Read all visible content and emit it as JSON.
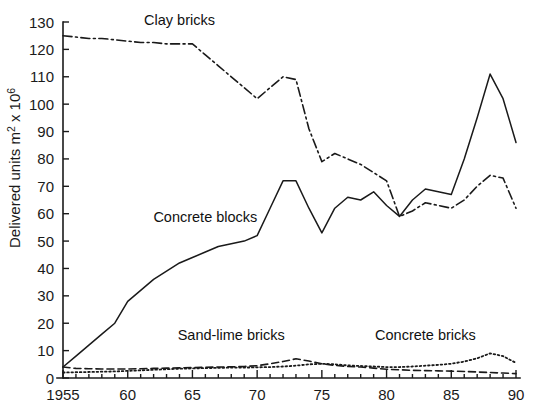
{
  "chart_data": {
    "type": "line",
    "title": "",
    "xlabel": "",
    "ylabel": "Delivered units m² x 10⁶",
    "ylabel_main": "Delivered units m",
    "ylabel_sup1": "2",
    "ylabel_mid": " x 10",
    "ylabel_sup2": "6",
    "xlim": [
      1955,
      1990
    ],
    "ylim": [
      0,
      130
    ],
    "grid": false,
    "legend_position": "inline-annotations",
    "y_ticks": [
      0,
      10,
      20,
      30,
      40,
      50,
      60,
      70,
      80,
      90,
      100,
      110,
      120,
      130
    ],
    "y_tick_labels": [
      "0",
      "10",
      "20",
      "30",
      "40",
      "50",
      "60",
      "70",
      "80",
      "90",
      "100",
      "110",
      "120",
      "130"
    ],
    "x_ticks": [
      1955,
      1960,
      1965,
      1970,
      1975,
      1980,
      1985,
      1990
    ],
    "x_tick_labels": [
      "1955",
      "60",
      "65",
      "70",
      "75",
      "80",
      "85",
      "90"
    ],
    "x_minor_step": 1,
    "x": [
      1955,
      1956,
      1957,
      1958,
      1959,
      1960,
      1961,
      1962,
      1963,
      1964,
      1965,
      1966,
      1967,
      1968,
      1969,
      1970,
      1971,
      1972,
      1973,
      1974,
      1975,
      1976,
      1977,
      1978,
      1979,
      1980,
      1981,
      1982,
      1983,
      1984,
      1985,
      1986,
      1987,
      1988,
      1989,
      1990
    ],
    "series": [
      {
        "name": "Clay bricks",
        "style": "dash-dot",
        "label_x": 1964,
        "label_y": 129,
        "values": [
          125,
          124.5,
          124,
          124,
          123.5,
          123,
          122.5,
          122.5,
          122,
          122,
          122,
          118,
          114,
          110,
          106,
          102,
          106,
          110,
          109,
          91,
          79,
          82,
          80,
          78,
          75,
          72,
          59,
          61,
          64,
          63,
          62,
          65,
          70,
          74,
          73,
          62
        ]
      },
      {
        "name": "Concrete blocks",
        "style": "solid",
        "label_x": 1966,
        "label_y": 57,
        "values": [
          4,
          8,
          12,
          16,
          20,
          28,
          32,
          36,
          39,
          42,
          44,
          46,
          48,
          49,
          50,
          52,
          62,
          72,
          72,
          62,
          53,
          62,
          66,
          65,
          68,
          63,
          59,
          65,
          69,
          68,
          67,
          80,
          95,
          111,
          102,
          86
        ]
      },
      {
        "name": "Sand-lime bricks",
        "style": "dashed",
        "label_x": 1968,
        "label_y": 14,
        "values": [
          4,
          3.5,
          3.4,
          3.3,
          3.3,
          3.3,
          3.4,
          3.5,
          3.6,
          3.7,
          3.8,
          3.9,
          4.0,
          4.1,
          4.2,
          4.5,
          5.2,
          6.0,
          7.0,
          6.2,
          5.2,
          4.6,
          4.2,
          4.0,
          3.6,
          3.2,
          3.0,
          2.8,
          2.7,
          2.6,
          2.5,
          2.4,
          2.2,
          2.0,
          1.8,
          1.6
        ]
      },
      {
        "name": "Concrete bricks",
        "style": "dotted",
        "label_x": 1983,
        "label_y": 14,
        "values": [
          2,
          2.1,
          2.2,
          2.3,
          2.4,
          2.6,
          2.8,
          3.0,
          3.2,
          3.4,
          3.5,
          3.6,
          3.7,
          3.8,
          3.8,
          3.9,
          4.0,
          4.2,
          4.5,
          5.0,
          5.2,
          5.0,
          4.6,
          4.4,
          4.2,
          4.0,
          4.0,
          4.2,
          4.5,
          4.8,
          5.2,
          6.0,
          7.2,
          9.0,
          8.0,
          5.5
        ]
      }
    ]
  }
}
